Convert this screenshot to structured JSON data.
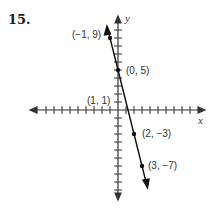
{
  "problem_number": "15.",
  "chart_data": {
    "type": "line",
    "title": "",
    "xlabel": "x",
    "ylabel": "y",
    "grid": false,
    "line": {
      "slope": -4,
      "intercept": 5,
      "equation": "y = -4x + 5"
    },
    "points": [
      {
        "x": -1,
        "y": 9,
        "label": "(−1, 9)"
      },
      {
        "x": 0,
        "y": 5,
        "label": "(0, 5)"
      },
      {
        "x": 1,
        "y": 1,
        "label": "(1, 1)"
      },
      {
        "x": 2,
        "y": -3,
        "label": "(2, −3)"
      },
      {
        "x": 3,
        "y": -7,
        "label": "(3, −7)"
      }
    ],
    "xlim": [
      -10,
      10
    ],
    "ylim": [
      -10,
      10
    ]
  }
}
